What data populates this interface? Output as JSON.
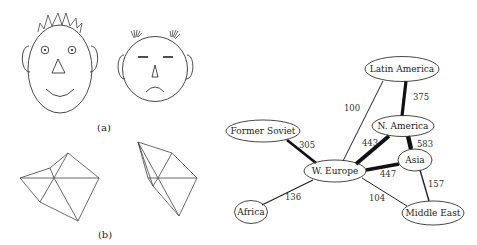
{
  "panels": {
    "a": {
      "label": "(a)",
      "description": "Two cartoon faces: happy spiky-haired oval face and sad round face"
    },
    "b": {
      "label": "(b)",
      "description": "Two triangulated polygon meshes"
    }
  },
  "graph": {
    "nodes": [
      {
        "id": "latin_america",
        "label": "Latin America"
      },
      {
        "id": "n_america",
        "label": "N. America"
      },
      {
        "id": "former_soviet",
        "label": "Former Soviet"
      },
      {
        "id": "w_europe",
        "label": "W. Europe"
      },
      {
        "id": "asia",
        "label": "Asia"
      },
      {
        "id": "africa",
        "label": "Africa"
      },
      {
        "id": "middle_east",
        "label": "Middle East"
      }
    ],
    "edges": [
      {
        "from": "w_europe",
        "to": "latin_america",
        "weight": "100"
      },
      {
        "from": "latin_america",
        "to": "n_america",
        "weight": "375"
      },
      {
        "from": "former_soviet",
        "to": "w_europe",
        "weight": "305"
      },
      {
        "from": "w_europe",
        "to": "n_america",
        "weight": "443"
      },
      {
        "from": "n_america",
        "to": "asia",
        "weight": "583"
      },
      {
        "from": "w_europe",
        "to": "asia",
        "weight": "447"
      },
      {
        "from": "asia",
        "to": "middle_east",
        "weight": "157"
      },
      {
        "from": "w_europe",
        "to": "middle_east",
        "weight": "104"
      },
      {
        "from": "w_europe",
        "to": "africa",
        "weight": "136"
      }
    ]
  }
}
